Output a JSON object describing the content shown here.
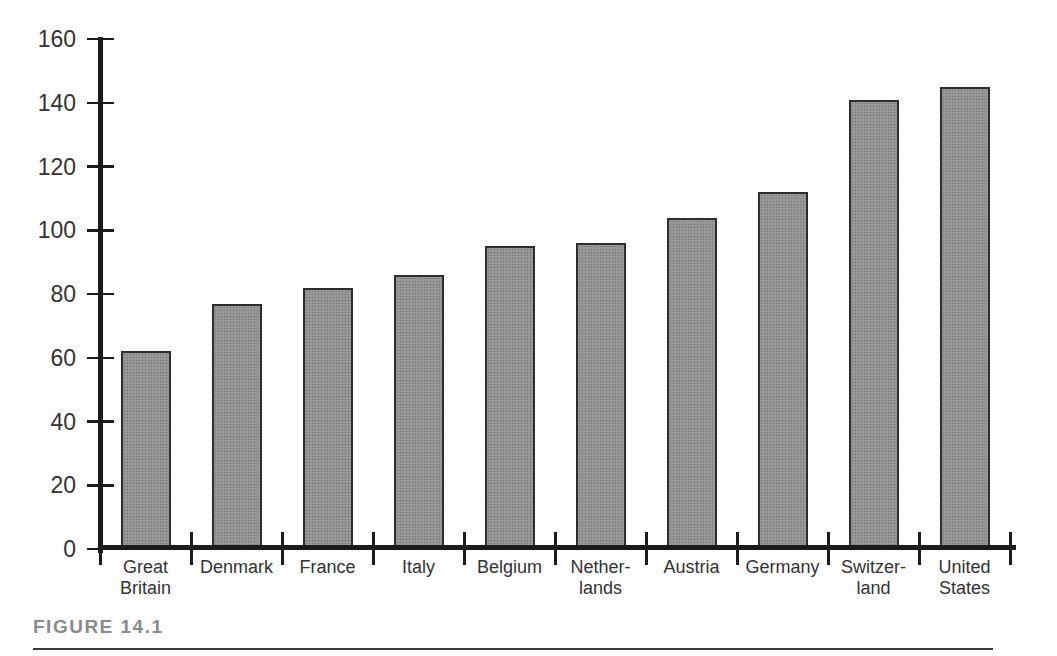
{
  "figure": {
    "label": "FIGURE 14.1"
  },
  "chart_data": {
    "type": "bar",
    "title": "",
    "xlabel": "",
    "ylabel": "",
    "categories": [
      "Great Britain",
      "Denmark",
      "France",
      "Italy",
      "Belgium",
      "Netherlands",
      "Austria",
      "Germany",
      "Switzerland",
      "United States"
    ],
    "category_display": [
      "Great\nBritain",
      "Denmark",
      "France",
      "Italy",
      "Belgium",
      "Nether-\nlands",
      "Austria",
      "Germany",
      "Switzer-\nland",
      "United\nStates"
    ],
    "values": [
      62,
      77,
      82,
      86,
      95,
      96,
      104,
      112,
      141,
      145
    ],
    "ylim": [
      0,
      160
    ],
    "yticks": [
      0,
      20,
      40,
      60,
      80,
      100,
      120,
      140,
      160
    ],
    "grid": false,
    "legend": null,
    "colors": {
      "bar_fill": "#9a9a9a",
      "bar_border": "#2d2d2d",
      "axis": "#1b1b1b",
      "tick_label": "#333333",
      "caption": "#8b8b8b",
      "caption_rule": "#3a3a3a",
      "background": "#fdfdfd"
    }
  }
}
